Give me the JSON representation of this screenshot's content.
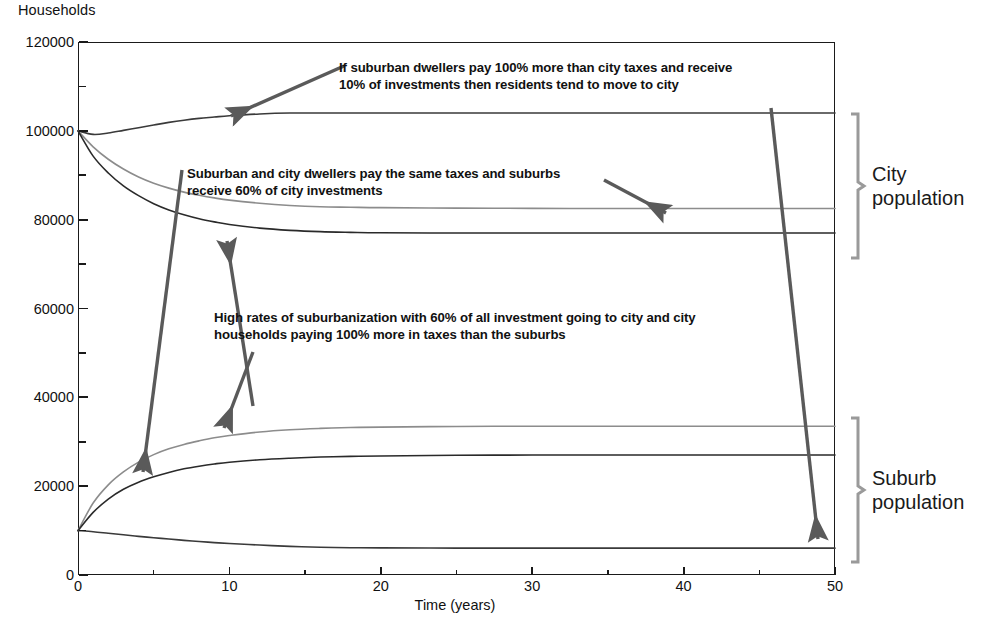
{
  "chart_data": {
    "type": "line",
    "title": "",
    "ylabel": "Households",
    "xlabel": "Time (years)",
    "xlim": [
      0,
      50
    ],
    "ylim": [
      0,
      120000
    ],
    "x_major_ticks": [
      0,
      10,
      20,
      30,
      40,
      50
    ],
    "x_minor_ticks": [
      5,
      15,
      25,
      35,
      45
    ],
    "y_major_ticks": [
      0,
      20000,
      40000,
      60000,
      80000,
      100000,
      120000
    ],
    "y_minor_ticks": [
      10000,
      30000,
      50000,
      70000,
      90000,
      110000
    ],
    "x_tick_labels": [
      "0",
      "10",
      "20",
      "30",
      "40",
      "50"
    ],
    "y_tick_labels": [
      "0",
      "20000",
      "40000",
      "60000",
      "80000",
      "100000",
      "120000"
    ],
    "grid": false,
    "legend_position": "right-brace-labels",
    "x": [
      0,
      1,
      2,
      3,
      4,
      5,
      6,
      7,
      8,
      9,
      10,
      12,
      14,
      16,
      18,
      20,
      25,
      30,
      35,
      40,
      45,
      50
    ],
    "series": [
      {
        "name": "City population - suburban dwellers pay 100% more taxes, 10% of investments",
        "group": "City population",
        "color": "#3a3a3a",
        "values": [
          100000,
          99200,
          99500,
          100100,
          100700,
          101300,
          101900,
          102400,
          102800,
          103100,
          103400,
          103800,
          104000,
          104000,
          104000,
          104000,
          104000,
          104000,
          104000,
          104000,
          104000,
          104000
        ]
      },
      {
        "name": "City population - same taxes, suburbs receive 60% of city investments",
        "group": "City population",
        "color": "#8c8c8c",
        "values": [
          100000,
          96400,
          93600,
          91400,
          89600,
          88200,
          87100,
          86200,
          85500,
          84900,
          84400,
          83700,
          83200,
          82900,
          82800,
          82700,
          82600,
          82550,
          82500,
          82500,
          82500,
          82500
        ]
      },
      {
        "name": "City population - high suburbanization, 60% investment to city, city pays 100% more taxes",
        "group": "City population",
        "color": "#2a2a2a",
        "values": [
          100000,
          94300,
          90500,
          87600,
          85400,
          83600,
          82200,
          81100,
          80200,
          79500,
          78900,
          78100,
          77600,
          77300,
          77150,
          77050,
          77000,
          77000,
          77000,
          77000,
          77000,
          77000
        ]
      },
      {
        "name": "Suburb population - same taxes, suburbs receive 60% of city investments",
        "group": "Suburb population",
        "color": "#8c8c8c",
        "values": [
          10000,
          16200,
          20300,
          23200,
          25400,
          27100,
          28400,
          29400,
          30200,
          30900,
          31400,
          32200,
          32700,
          33000,
          33200,
          33300,
          33450,
          33500,
          33500,
          33500,
          33500,
          33500
        ]
      },
      {
        "name": "Suburb population - high suburbanization, 60% investment to city, city pays 100% more taxes",
        "group": "Suburb population",
        "color": "#2a2a2a",
        "values": [
          10000,
          14100,
          17100,
          19300,
          20900,
          22100,
          23100,
          23900,
          24500,
          25000,
          25400,
          25950,
          26300,
          26550,
          26700,
          26800,
          26950,
          27000,
          27000,
          27000,
          27000,
          27000
        ]
      },
      {
        "name": "Suburb population - suburban dwellers pay 100% more taxes, 10% of investments",
        "group": "Suburb population",
        "color": "#3a3a3a",
        "values": [
          10000,
          9750,
          9400,
          9050,
          8700,
          8400,
          8100,
          7800,
          7550,
          7300,
          7100,
          6750,
          6450,
          6250,
          6150,
          6100,
          6050,
          6050,
          6050,
          6050,
          6050,
          6050
        ]
      }
    ],
    "annotations": [
      {
        "id": "annotation-top",
        "text": "If suburban dwellers pay 100% more than city taxes and receive\n10% of investments then residents tend to move to city"
      },
      {
        "id": "annotation-middle",
        "text": "Suburban and city dwellers pay the same taxes and suburbs\nreceive 60% of city investments"
      },
      {
        "id": "annotation-bottom",
        "text": "High rates of suburbanization with 60% of all investment going to city and city\nhouseholds paying 100% more in taxes than the suburbs"
      }
    ],
    "group_labels": [
      {
        "id": "city-population",
        "line1": "City",
        "line2": "population"
      },
      {
        "id": "suburb-population",
        "line1": "Suburb",
        "line2": "population"
      }
    ]
  }
}
